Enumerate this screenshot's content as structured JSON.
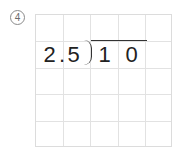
{
  "problem": {
    "number_label": "4",
    "number_display": "④"
  },
  "grid": {
    "columns": 5,
    "rows": 5,
    "line_color": "#e2e2e2"
  },
  "division": {
    "divisor": "2.5",
    "dividend": "10",
    "cells": {
      "divisor_int": "2",
      "decimal_point": ".",
      "divisor_frac": "5",
      "dividend_d1": "1",
      "dividend_d2": "0"
    }
  }
}
